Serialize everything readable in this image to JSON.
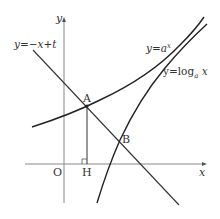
{
  "diagram": {
    "type": "function-graph",
    "axes": {
      "x_label": "x",
      "y_label": "y",
      "origin_label": "O"
    },
    "curves": [
      {
        "name": "exponential",
        "label": "y=a^x",
        "label_main": "y=a",
        "label_sup": "x"
      },
      {
        "name": "logarithm",
        "label": "y=log_a x",
        "label_main": "y=log",
        "label_sub": "a",
        "label_tail": " x"
      },
      {
        "name": "line",
        "label": "y=−x+t"
      }
    ],
    "points": [
      {
        "name": "A",
        "label": "A"
      },
      {
        "name": "B",
        "label": "B"
      },
      {
        "name": "H",
        "label": "H"
      }
    ],
    "colors": {
      "curve": "#222222",
      "axis": "#777777",
      "text": "#333333"
    }
  }
}
